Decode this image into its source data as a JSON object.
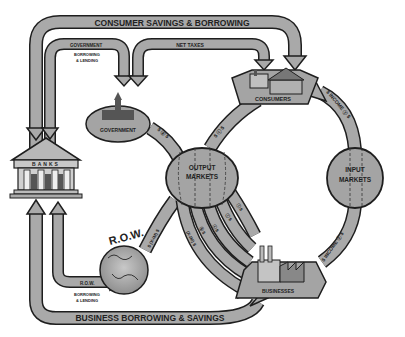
{
  "diagram": {
    "type": "circular-flow-economy",
    "colors": {
      "arrow_fill": "#a9a9a9",
      "arrow_stroke": "#1e1e1e",
      "node_fill": "#a4a4a4",
      "background": "#ffffff"
    },
    "nodes": {
      "banks": {
        "label": "BANKS"
      },
      "government": {
        "label": "GOVERNMENT"
      },
      "consumers": {
        "label": "CONSUMERS"
      },
      "output_markets": {
        "label_line1": "OUTPUT",
        "label_line2": "MARKETS"
      },
      "input_markets": {
        "label_line1": "INPUT",
        "label_line2": "MARKETS"
      },
      "row": {
        "label": "R.O.W."
      },
      "businesses": {
        "label": "BUSINESSES"
      }
    },
    "flows": {
      "consumer_savings": {
        "label": "CONSUMER SAVINGS & BORROWING"
      },
      "government_borrowing": {
        "label_line1": "GOVERNMENT",
        "label_line2": "BORROWING",
        "label_line3": "& LENDING"
      },
      "net_taxes": {
        "label": "NET TAXES"
      },
      "income_top": {
        "label": "$ INCOME ⓨ $"
      },
      "income_bottom": {
        "label": "$ INCOME ⓨ $"
      },
      "gov_to_output": {
        "label": "$ ⓖ $"
      },
      "consumers_to_output": {
        "label": "$ ⓒ $"
      },
      "row_to_output": {
        "label": "$ (X-IM) $"
      },
      "row_borrowing": {
        "label_line1": "R.O.W.",
        "label_line2": "BORROWING",
        "label_line3": "& LENDING"
      },
      "business_borrowing": {
        "label": "BUSINESS BORROWING & SAVINGS"
      },
      "output_to_business": [
        {
          "label": "(X-IM) $"
        },
        {
          "label": "ⓖ $"
        },
        {
          "label": "ⓒ $"
        },
        {
          "label": "ⓘ $"
        },
        {
          "label": "ⓘ $"
        }
      ]
    }
  }
}
